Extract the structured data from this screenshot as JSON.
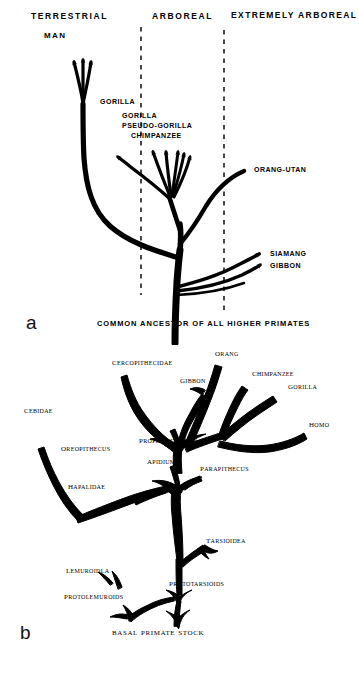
{
  "figure_a": {
    "panel_letter": "a",
    "zone_headers": [
      {
        "label": "TERRESTRIAL",
        "x": 31,
        "y": 12
      },
      {
        "label": "ARBOREAL",
        "x": 152,
        "y": 12
      },
      {
        "label": "EXTREMELY ARBOREAL",
        "x": 231,
        "y": 10
      }
    ],
    "divider_lines": [
      {
        "x": 141,
        "y1": 27,
        "y2": 295
      },
      {
        "x": 224,
        "y1": 30,
        "y2": 312
      }
    ],
    "tip_labels": [
      {
        "label": "MAN",
        "x": 44,
        "y": 32
      },
      {
        "label": "GORILLA",
        "x": 100,
        "y": 98
      },
      {
        "label": "GORILLA",
        "x": 122,
        "y": 113
      },
      {
        "label": "PSEUDO-GORILLA",
        "x": 122,
        "y": 123
      },
      {
        "label": "CHIMPANZEE",
        "x": 131,
        "y": 133
      },
      {
        "label": "ORANG-UTAN",
        "x": 254,
        "y": 166
      },
      {
        "label": "SIAMANG",
        "x": 270,
        "y": 251
      },
      {
        "label": "GIBBON",
        "x": 270,
        "y": 263
      }
    ],
    "caption": "COMMON ANCESTOR OF ALL HIGHER PRIMATES",
    "caption_x": 97,
    "caption_y": 322
  },
  "figure_b": {
    "panel_letter": "b",
    "tip_labels": [
      {
        "label": "Cercopithecidae",
        "x": 112,
        "y": 14
      },
      {
        "label": "Orang",
        "x": 215,
        "y": 5
      },
      {
        "label": "Gibbon",
        "x": 180,
        "y": 32
      },
      {
        "label": "Chimpanzee",
        "x": 254,
        "y": 25
      },
      {
        "label": "Gorilla",
        "x": 290,
        "y": 37
      },
      {
        "label": "Cebidae",
        "x": 24,
        "y": 62
      },
      {
        "label": "Homo",
        "x": 310,
        "y": 76
      },
      {
        "label": "Oreopithecus",
        "x": 62,
        "y": 100
      },
      {
        "label": "Propliopithecus",
        "x": 140,
        "y": 92
      },
      {
        "label": "Apidium",
        "x": 148,
        "y": 113
      },
      {
        "label": "Parapithecus",
        "x": 200,
        "y": 120
      },
      {
        "label": "Hapalidae",
        "x": 68,
        "y": 138
      },
      {
        "label": "Tarsioidea",
        "x": 206,
        "y": 192
      },
      {
        "label": "Lemuroidla",
        "x": 67,
        "y": 222
      },
      {
        "label": "Prototarsioids",
        "x": 170,
        "y": 235
      },
      {
        "label": "Protolemuroids",
        "x": 65,
        "y": 248
      }
    ],
    "caption": "Basal Primate Stock",
    "caption_x": 112,
    "caption_y": 286
  },
  "style": {
    "ink": "#000000",
    "paper": "#ffffff"
  }
}
